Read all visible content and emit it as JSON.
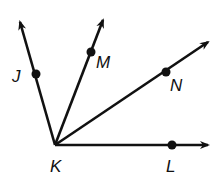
{
  "diagram": {
    "type": "rays-from-vertex",
    "vertex": {
      "label": "K",
      "x": 55,
      "y": 145,
      "label_x": 50,
      "label_y": 172
    },
    "rays": [
      {
        "name": "KJ",
        "tip": [
          20,
          22
        ],
        "point": {
          "label": "J",
          "x": 36,
          "y": 74,
          "label_x": 12,
          "label_y": 82
        }
      },
      {
        "name": "KM",
        "tip": [
          103,
          20
        ],
        "point": {
          "label": "M",
          "x": 91,
          "y": 52,
          "label_x": 96,
          "label_y": 68
        }
      },
      {
        "name": "KN",
        "tip": [
          208,
          42
        ],
        "point": {
          "label": "N",
          "x": 166,
          "y": 72,
          "label_x": 170,
          "label_y": 91
        }
      },
      {
        "name": "KL",
        "tip": [
          208,
          145
        ],
        "point": {
          "label": "L",
          "x": 172,
          "y": 145,
          "label_x": 166,
          "label_y": 172
        }
      }
    ],
    "colors": {
      "stroke": "#111111",
      "background": "#ffffff"
    }
  }
}
